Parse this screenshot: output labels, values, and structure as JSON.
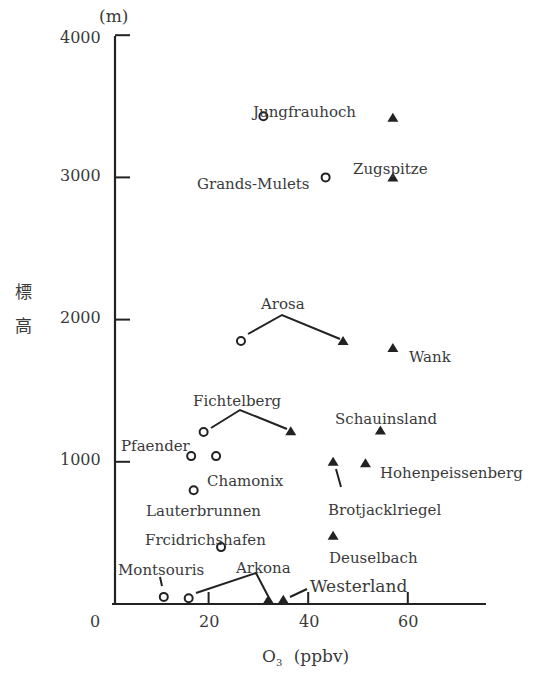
{
  "chart_data": {
    "type": "scatter",
    "title": "",
    "xlabel": "O3 (ppbv)",
    "xlabel_main": "O",
    "xlabel_sub": "3",
    "xlabel_unit": "(ppbv)",
    "ylabel": "標高",
    "ylabel_chars": [
      "標",
      "高"
    ],
    "y_unit": "(m)",
    "xlim": [
      0,
      75
    ],
    "ylim": [
      0,
      4000
    ],
    "x_ticks": [
      0,
      20,
      40,
      60
    ],
    "y_ticks": [
      1000,
      2000,
      3000,
      4000
    ],
    "grid": false,
    "legend": "none",
    "series": [
      {
        "name": "circle (open)",
        "marker": "open-circle",
        "points": [
          {
            "station": "Jungfrauhoch",
            "x": 31,
            "y": 3430
          },
          {
            "station": "Grands-Mulets",
            "x": 43.5,
            "y": 3000
          },
          {
            "station": "Arosa",
            "x": 26.5,
            "y": 1850
          },
          {
            "station": "Fichtelberg",
            "x": 19,
            "y": 1210
          },
          {
            "station": "Pfaender",
            "x": 16.5,
            "y": 1040
          },
          {
            "station": "Chamonix",
            "x": 21.5,
            "y": 1040
          },
          {
            "station": "Lauterbrunnen",
            "x": 17,
            "y": 800
          },
          {
            "station": "Frcidrichshafen",
            "x": 22.5,
            "y": 400
          },
          {
            "station": "Montsouris",
            "x": 11,
            "y": 50
          },
          {
            "station": "Arkona",
            "x": 16,
            "y": 40
          }
        ]
      },
      {
        "name": "triangle (filled)",
        "marker": "filled-triangle",
        "points": [
          {
            "station": "Jungfrauhoch",
            "x": 57,
            "y": 3420
          },
          {
            "station": "Zugspitze",
            "x": 57,
            "y": 3000
          },
          {
            "station": "Arosa",
            "x": 47,
            "y": 1850
          },
          {
            "station": "Wank",
            "x": 57,
            "y": 1800
          },
          {
            "station": "Fichtelberg",
            "x": 36.5,
            "y": 1215
          },
          {
            "station": "Schauinsland",
            "x": 54.5,
            "y": 1220
          },
          {
            "station": "Brotjacklriegel",
            "x": 45,
            "y": 1000
          },
          {
            "station": "Hohenpeissenberg",
            "x": 51.5,
            "y": 990
          },
          {
            "station": "Deuselbach",
            "x": 45,
            "y": 480
          },
          {
            "station": "Arkona",
            "x": 32,
            "y": 30
          },
          {
            "station": "Westerland",
            "x": 35,
            "y": 30
          }
        ]
      }
    ],
    "annotations": [
      {
        "text": "Jungfrauhoch",
        "px": 253,
        "py": 105
      },
      {
        "text": "Zugspitze",
        "px": 353,
        "py": 162
      },
      {
        "text": "Grands-Mulets",
        "px": 197,
        "py": 177
      },
      {
        "text": "Arosa",
        "px": 261,
        "py": 297
      },
      {
        "text": "Wank",
        "px": 409,
        "py": 350
      },
      {
        "text": "Fichtelberg",
        "px": 193,
        "py": 394
      },
      {
        "text": "Schauinsland",
        "px": 335,
        "py": 412
      },
      {
        "text": "Pfaender",
        "px": 121,
        "py": 439
      },
      {
        "text": "Chamonix",
        "px": 207,
        "py": 474
      },
      {
        "text": "Hohenpeissenberg",
        "px": 380,
        "py": 466
      },
      {
        "text": "Lauterbrunnen",
        "px": 146,
        "py": 504
      },
      {
        "text": "Brotjacklriegel",
        "px": 328,
        "py": 503
      },
      {
        "text": "Frcidrichshafen",
        "px": 145,
        "py": 533
      },
      {
        "text": "Deuselbach",
        "px": 329,
        "py": 551
      },
      {
        "text": "Montsouris",
        "px": 118,
        "py": 563
      },
      {
        "text": "Arkona",
        "px": 236,
        "py": 561
      },
      {
        "text": "Westerland",
        "px": 310,
        "py": 578
      }
    ]
  }
}
